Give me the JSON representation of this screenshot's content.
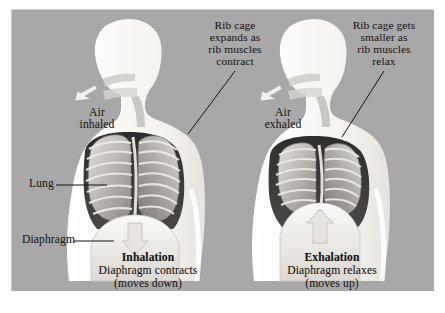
{
  "figure": {
    "background_color": "#a8a8a8",
    "border_color": "#ffffff",
    "text_color": "#16110f"
  },
  "panels": [
    {
      "id": "inhalation",
      "phase_title": "Inhalation",
      "phase_subtitle": "Diaphragm contracts\n(moves down)",
      "ribcage_note": "Rib cage\nexpands as\nrib muscles\ncontract",
      "air_label": "Air\ninhaled",
      "organ_labels": [
        {
          "name": "lung",
          "text": "Lung"
        },
        {
          "name": "diaphragm",
          "text": "Diaphragm"
        }
      ],
      "arrow_direction": "down"
    },
    {
      "id": "exhalation",
      "phase_title": "Exhalation",
      "phase_subtitle": "Diaphragm relaxes\n(moves up)",
      "ribcage_note": "Rib cage gets\nsmaller as\nrib muscles\nrelax",
      "air_label": "Air\nexhaled",
      "organ_labels": [],
      "arrow_direction": "up"
    }
  ],
  "colors": {
    "body_silhouette": "#f7f5f2",
    "lung_light": "#d8d6d2",
    "lung_mid": "#b3b0ab",
    "lung_dark": "#7d7a76",
    "cavity_shadow": "#3a3836",
    "rib_line": "#8b8883",
    "arrow_fill": "#e9e7e3",
    "leader_line": "#181410"
  }
}
